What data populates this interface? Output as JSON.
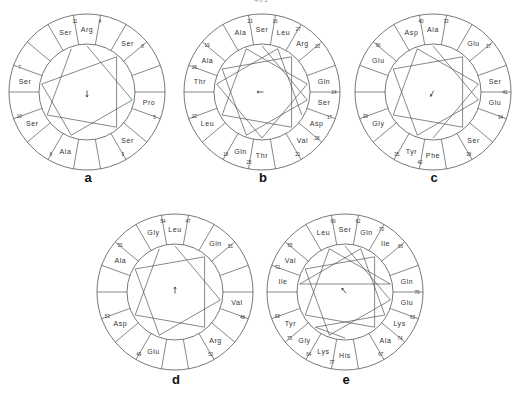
{
  "page_number": "401",
  "figure": {
    "type": "helical-wheel-projections",
    "sectors_per_wheel": 18,
    "line_color": "#555555",
    "text_color": "#333333"
  },
  "wheels": [
    {
      "id": "a",
      "label": "a",
      "center": [
        87,
        92
      ],
      "polygon_vertices": 5,
      "arrow": "down",
      "residues": [
        {
          "sector": 0,
          "name": "Arg",
          "num": "4"
        },
        {
          "sector": 17,
          "name": "Ser",
          "num": "11"
        },
        {
          "sector": 2,
          "name": "Ser",
          "num": "8"
        },
        {
          "sector": 14,
          "name": "Ser",
          "num": "7"
        },
        {
          "sector": 5,
          "name": "Pro",
          "num": "5"
        },
        {
          "sector": 12,
          "name": "Ser",
          "num": "10"
        },
        {
          "sector": 7,
          "name": "Ser",
          "num": "9"
        },
        {
          "sector": 10,
          "name": "Ala",
          "num": "6"
        }
      ]
    },
    {
      "id": "b",
      "label": "b",
      "center": [
        262,
        92
      ],
      "polygon_vertices": 11,
      "arrow": "left",
      "residues": [
        {
          "sector": 0,
          "name": "Ser",
          "num": "16"
        },
        {
          "sector": 17,
          "name": "Ala",
          "num": "23"
        },
        {
          "sector": 1,
          "name": "Leu",
          "num": "27"
        },
        {
          "sector": 2,
          "name": "Arg",
          "num": "20"
        },
        {
          "sector": 15,
          "name": "Ala",
          "num": "19"
        },
        {
          "sector": 14,
          "name": "Thr",
          "num": "26"
        },
        {
          "sector": 4,
          "name": "Gln",
          "num": "24"
        },
        {
          "sector": 5,
          "name": "Ser",
          "num": "17"
        },
        {
          "sector": 12,
          "name": "Leu",
          "num": "22"
        },
        {
          "sector": 6,
          "name": "Asp",
          "num": "28"
        },
        {
          "sector": 7,
          "name": "Val",
          "num": "21"
        },
        {
          "sector": 10,
          "name": "Gln",
          "num": "18"
        },
        {
          "sector": 9,
          "name": "Thr",
          "num": "25"
        }
      ]
    },
    {
      "id": "c",
      "label": "c",
      "center": [
        433,
        92
      ],
      "polygon_vertices": 7,
      "arrow": "down-left",
      "residues": [
        {
          "sector": 0,
          "name": "Ala",
          "num": "33"
        },
        {
          "sector": 17,
          "name": "Asp",
          "num": "40"
        },
        {
          "sector": 2,
          "name": "Glu",
          "num": "37"
        },
        {
          "sector": 15,
          "name": "Glu",
          "num": "36"
        },
        {
          "sector": 4,
          "name": "Ser",
          "num": "41"
        },
        {
          "sector": 5,
          "name": "Glu",
          "num": "34"
        },
        {
          "sector": 12,
          "name": "Gly",
          "num": "39"
        },
        {
          "sector": 7,
          "name": "Ser",
          "num": "38"
        },
        {
          "sector": 10,
          "name": "Tyr",
          "num": "35"
        },
        {
          "sector": 9,
          "name": "Phe",
          "num": "42"
        }
      ]
    },
    {
      "id": "d",
      "label": "d",
      "center": [
        175,
        292
      ],
      "polygon_vertices": 5,
      "arrow": "up",
      "residues": [
        {
          "sector": 0,
          "name": "Leu",
          "num": "47"
        },
        {
          "sector": 17,
          "name": "Gly",
          "num": "54"
        },
        {
          "sector": 2,
          "name": "Gln",
          "num": "51"
        },
        {
          "sector": 15,
          "name": "Ala",
          "num": "50"
        },
        {
          "sector": 5,
          "name": "Val",
          "num": "48"
        },
        {
          "sector": 12,
          "name": "Asp",
          "num": "53"
        },
        {
          "sector": 7,
          "name": "Arg",
          "num": "52"
        },
        {
          "sector": 10,
          "name": "Glu",
          "num": "49"
        }
      ]
    },
    {
      "id": "e",
      "label": "e",
      "center": [
        345,
        292
      ],
      "polygon_vertices": 14,
      "arrow": "up-left",
      "residues": [
        {
          "sector": 0,
          "name": "Ser",
          "num": "62"
        },
        {
          "sector": 17,
          "name": "Leu",
          "num": "69"
        },
        {
          "sector": 1,
          "name": "Gln",
          "num": "73"
        },
        {
          "sector": 2,
          "name": "Ile",
          "num": "66"
        },
        {
          "sector": 15,
          "name": "Val",
          "num": "65"
        },
        {
          "sector": 14,
          "name": "Ile",
          "num": "72"
        },
        {
          "sector": 4,
          "name": "Gln",
          "num": "70"
        },
        {
          "sector": 5,
          "name": "Glu",
          "num": "63"
        },
        {
          "sector": 12,
          "name": "Tyr",
          "num": "68"
        },
        {
          "sector": 6,
          "name": "Lys",
          "num": "74"
        },
        {
          "sector": 7,
          "name": "Ala",
          "num": "67"
        },
        {
          "sector": 11,
          "name": "Gly",
          "num": "75"
        },
        {
          "sector": 10,
          "name": "Lys",
          "num": "64"
        },
        {
          "sector": 9,
          "name": "His",
          "num": "77"
        }
      ]
    }
  ]
}
